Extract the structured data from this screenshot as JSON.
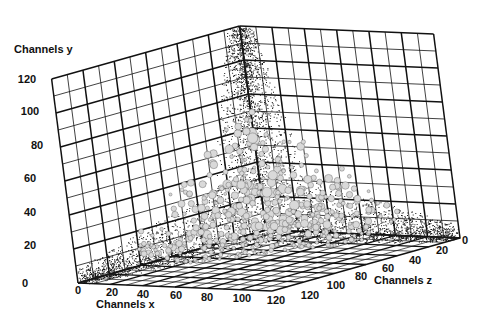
{
  "chart_data": {
    "type": "scatter3d",
    "title": "",
    "xlabel": "Channels x",
    "ylabel": "Channels y",
    "zlabel": "Channels z",
    "xlim": [
      0,
      120
    ],
    "ylim": [
      0,
      120
    ],
    "zlim": [
      0,
      120
    ],
    "x_ticks": [
      "0",
      "20",
      "40",
      "60",
      "80",
      "100",
      "120"
    ],
    "y_ticks": [
      "0",
      "20",
      "40",
      "60",
      "80",
      "100",
      "120"
    ],
    "z_ticks": [
      "0",
      "20",
      "40",
      "60",
      "80",
      "100",
      "120"
    ],
    "grid": true,
    "arms": [
      {
        "name": "vertical arm",
        "from": {
          "x": 0,
          "y": 0,
          "z": 0
        },
        "to": {
          "x": 0,
          "y": 120,
          "z": 0
        }
      },
      {
        "name": "x arm",
        "from": {
          "x": 0,
          "y": 0,
          "z": 0
        },
        "to": {
          "x": 120,
          "y": 0,
          "z": 0
        }
      },
      {
        "name": "z arm",
        "from": {
          "x": 0,
          "y": 0,
          "z": 0
        },
        "to": {
          "x": 0,
          "y": 0,
          "z": 120
        }
      }
    ],
    "marker_color": "#1a1a1a",
    "bubble_color": "#d9d9d9"
  },
  "labels": {
    "x_axis": "Channels x",
    "y_axis": "Channels y",
    "z_axis": "Channels z"
  },
  "ticks": {
    "x": [
      "0",
      "20",
      "40",
      "60",
      "80",
      "100",
      "120"
    ],
    "y": [
      "0",
      "20",
      "40",
      "60",
      "80",
      "100",
      "120"
    ],
    "z": [
      "0",
      "20",
      "40",
      "60",
      "80",
      "100",
      "120"
    ]
  }
}
